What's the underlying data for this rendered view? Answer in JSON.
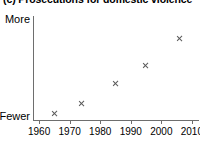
{
  "chart_data": {
    "type": "scatter",
    "title": "(c) Prosecutions for domestic violence",
    "xlabel": "",
    "ylabel": "",
    "xlim": [
      1958,
      2012
    ],
    "ylim": [
      0,
      10
    ],
    "grid": false,
    "legend": null,
    "y_axis_type": "qualitative",
    "y_low_label": "Fewer",
    "y_high_label": "More",
    "xticks": [
      1960,
      1970,
      1980,
      1990,
      2000,
      2010
    ],
    "xticklabels": [
      "1960",
      "1970",
      "1980",
      "1990",
      "2000",
      "2010"
    ],
    "marker": "x",
    "marker_color": "#5a5a5a",
    "x": [
      1965,
      1974,
      1985,
      1995,
      2006
    ],
    "values": [
      0.6,
      1.6,
      3.5,
      5.2,
      7.8
    ],
    "points": [
      {
        "x": 1965,
        "y": 0.6
      },
      {
        "x": 1974,
        "y": 1.6
      },
      {
        "x": 1985,
        "y": 3.5
      },
      {
        "x": 1995,
        "y": 5.2
      },
      {
        "x": 2006,
        "y": 7.8
      }
    ]
  },
  "axis": {
    "line_color": "#6e6e6e"
  }
}
